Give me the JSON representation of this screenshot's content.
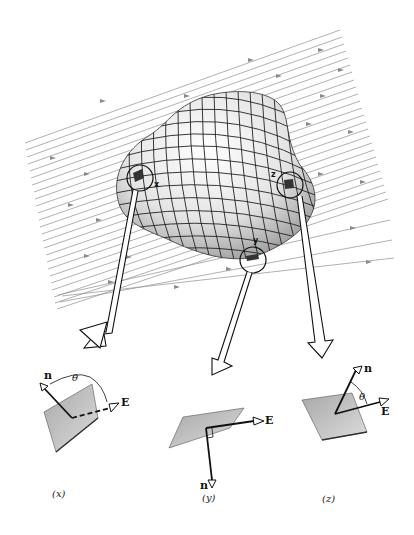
{
  "figure": {
    "field_line_color": "#8a8a8a",
    "surface_fill": "#e8e8e8",
    "grid_color": "#222222",
    "patch_fill": "#9a9a9a"
  },
  "surface_markers": [
    {
      "id": "x",
      "label": "x"
    },
    {
      "id": "y",
      "label": "y"
    },
    {
      "id": "z",
      "label": "z"
    }
  ],
  "panels": [
    {
      "id": "x",
      "caption": "(x)",
      "normal_label": "n",
      "field_label": "E",
      "angle_label": "θ",
      "note": "angle between n and E greater than 90°"
    },
    {
      "id": "y",
      "caption": "(y)",
      "normal_label": "n",
      "field_label": "E",
      "angle_label": "",
      "note": "n perpendicular to E"
    },
    {
      "id": "z",
      "caption": "(z)",
      "normal_label": "n",
      "field_label": "E",
      "angle_label": "θ",
      "note": "angle between n and E less than 90°"
    }
  ]
}
